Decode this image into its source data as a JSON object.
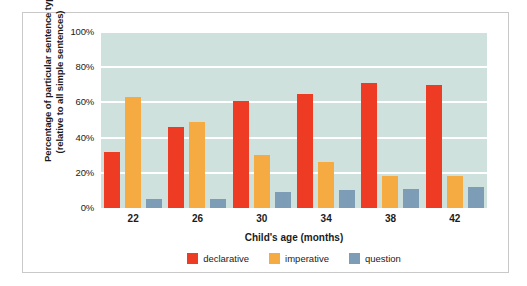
{
  "chart_data": {
    "type": "bar",
    "title": "",
    "subtitle": "",
    "xlabel": "Child's age (months)",
    "ylabel": "Percentage of particular sentence types (relative to all simple sentences)",
    "ylabel_lines": [
      "Percentage of particular sentence types",
      "(relative to all simple sentences)"
    ],
    "categories": [
      "22",
      "26",
      "30",
      "34",
      "38",
      "42"
    ],
    "series": [
      {
        "name": "declarative",
        "color": "#ee3b24",
        "values": [
          32,
          46,
          61,
          65,
          71,
          70
        ]
      },
      {
        "name": "imperative",
        "color": "#f6ab42",
        "values": [
          63,
          49,
          30,
          26,
          18,
          18
        ]
      },
      {
        "name": "question",
        "color": "#7d9cb6",
        "values": [
          5,
          5,
          9,
          10,
          11,
          12
        ]
      }
    ],
    "ylim": [
      0,
      100
    ],
    "ytick_labels": [
      "0%",
      "20%",
      "40%",
      "60%",
      "80%",
      "100%"
    ],
    "ytick_values": [
      0,
      20,
      40,
      60,
      80,
      100
    ],
    "grid": true,
    "grid_color": "#ffffff",
    "plot_background": "#cfe1dd",
    "legend_position": "bottom-center",
    "legend": [
      {
        "label": "declarative",
        "color": "#ee3b24"
      },
      {
        "label": "imperative",
        "color": "#f6ab42"
      },
      {
        "label": "question",
        "color": "#7d9cb6"
      }
    ]
  }
}
